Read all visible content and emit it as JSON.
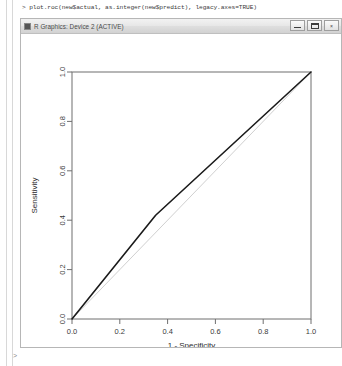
{
  "console": {
    "command": "> plot.roc(new$actual, as.integer(new$predict), legacy.axes=TRUE)",
    "caret": ">"
  },
  "window": {
    "title": "R Graphics: Device 2 (ACTIVE)",
    "icon": "r-graphics-icon",
    "controls": [
      {
        "name": "minimize-button",
        "label": "–"
      },
      {
        "name": "maximize-button",
        "label": "□"
      },
      {
        "name": "close-button",
        "label": "×"
      }
    ]
  },
  "chart_data": {
    "type": "line",
    "title": "",
    "xlabel": "1 - Specificity",
    "ylabel": "Sensitivity",
    "xlim": [
      0,
      1
    ],
    "ylim": [
      0,
      1
    ],
    "grid": false,
    "legend": "none",
    "xticks": [
      "0.0",
      "0.2",
      "0.4",
      "0.6",
      "0.8",
      "1.0"
    ],
    "xtick_values": [
      0.0,
      0.2,
      0.4,
      0.6,
      0.8,
      1.0
    ],
    "yticks": [
      "0.0",
      "0.2",
      "0.4",
      "0.6",
      "0.8",
      "1.0"
    ],
    "ytick_values": [
      0.0,
      0.2,
      0.4,
      0.6,
      0.8,
      1.0
    ],
    "series": [
      {
        "name": "ROC curve",
        "color": "#1a1a1a",
        "width": 1.6,
        "x": [
          0.0,
          0.35,
          1.0
        ],
        "y": [
          0.0,
          0.42,
          1.0
        ]
      },
      {
        "name": "chance diagonal",
        "color": "#d0d0d0",
        "width": 1.0,
        "x": [
          0.0,
          1.0
        ],
        "y": [
          0.0,
          1.0
        ]
      }
    ]
  }
}
